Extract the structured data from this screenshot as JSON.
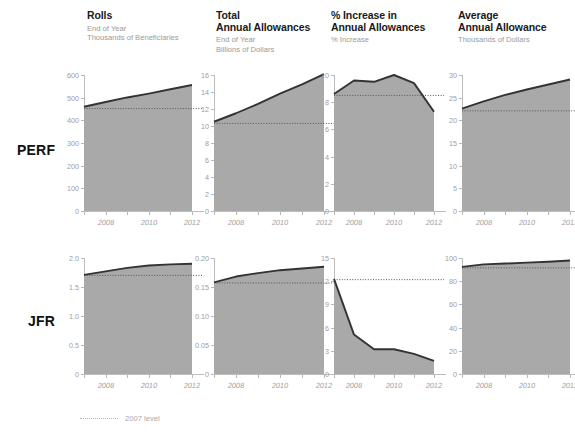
{
  "legend": {
    "label": "2007 level",
    "icon": "dotted-line-icon"
  },
  "row_labels": [
    "PERF",
    "JFR"
  ],
  "colors": {
    "fill": "#a9a9a9",
    "line": "#333333",
    "dotted": "#555555",
    "axis": "#bdbdbd",
    "tick_text": "#9d9d9d",
    "title": "#1a1a1a",
    "subtitle": "#9a9a9a"
  },
  "columns": [
    {
      "title": "Rolls",
      "subtitle": "End of Year\nThousands of Beneficiaries"
    },
    {
      "title": "Total\nAnnual Allowances",
      "subtitle": "End of Year\nBillions of Dollars"
    },
    {
      "title": "% Increase in\n Annual Allowances",
      "subtitle": "% Increase"
    },
    {
      "title": "Average\nAnnual Allowance",
      "subtitle": "Thousands of Dollars"
    }
  ],
  "chart_data": [
    {
      "type": "area",
      "title": "Rolls",
      "row": "PERF",
      "xlabel": "",
      "ylabel": "Thousands of Beneficiaries",
      "x": [
        2007,
        2008,
        2009,
        2010,
        2011,
        2012
      ],
      "xticks": [
        2008,
        2010,
        2012
      ],
      "values": [
        460,
        481,
        501,
        518,
        537,
        556
      ],
      "ylim": [
        0,
        600
      ],
      "yticks": [
        0,
        100,
        200,
        300,
        400,
        500,
        600
      ],
      "ytick_labels": [
        "0",
        "100",
        "200",
        "300",
        "400",
        "500",
        "600"
      ],
      "reference_line": {
        "label": "2007 level",
        "value": 452
      },
      "grid": false,
      "legend": "bottom"
    },
    {
      "type": "area",
      "title": "Total Annual Allowances",
      "row": "PERF",
      "xlabel": "",
      "ylabel": "Billions of Dollars",
      "x": [
        2007,
        2008,
        2009,
        2010,
        2011,
        2012
      ],
      "xticks": [
        2008,
        2010,
        2012
      ],
      "values": [
        10.5,
        11.5,
        12.6,
        13.8,
        14.9,
        16.1
      ],
      "ylim": [
        0,
        16
      ],
      "yticks": [
        0,
        2,
        4,
        6,
        8,
        10,
        12,
        14,
        16
      ],
      "ytick_labels": [
        "0",
        "2",
        "4",
        "6",
        "8",
        "10",
        "12",
        "14",
        "16"
      ],
      "reference_line": {
        "label": "2007 level",
        "value": 10.3
      },
      "grid": false,
      "legend": "bottom"
    },
    {
      "type": "area",
      "title": "% Increase in Annual Allowances",
      "row": "PERF",
      "xlabel": "",
      "ylabel": "% Increase",
      "x": [
        2007,
        2008,
        2009,
        2010,
        2011,
        2012
      ],
      "xticks": [
        2008,
        2010,
        2012
      ],
      "values": [
        8.6,
        9.6,
        9.5,
        10.0,
        9.4,
        7.3
      ],
      "ylim": [
        0,
        10
      ],
      "yticks": [
        0,
        2,
        4,
        6,
        8,
        10
      ],
      "ytick_labels": [
        "0",
        "2",
        "4",
        "6",
        "8",
        "10"
      ],
      "reference_line": {
        "label": "2007 level",
        "value": 8.5
      },
      "grid": false,
      "legend": "bottom"
    },
    {
      "type": "area",
      "title": "Average Annual Allowance",
      "row": "PERF",
      "xlabel": "",
      "ylabel": "Thousands of Dollars",
      "x": [
        2007,
        2008,
        2009,
        2010,
        2011,
        2012
      ],
      "xticks": [
        2008,
        2010,
        2012
      ],
      "values": [
        22.6,
        24.2,
        25.6,
        26.8,
        27.9,
        29.0
      ],
      "ylim": [
        0,
        30
      ],
      "yticks": [
        0,
        5,
        10,
        15,
        20,
        25,
        30
      ],
      "ytick_labels": [
        "0",
        "5",
        "10",
        "15",
        "20",
        "25",
        "30"
      ],
      "reference_line": {
        "label": "2007 level",
        "value": 22.1
      },
      "grid": false,
      "legend": "bottom"
    },
    {
      "type": "area",
      "title": "Rolls",
      "row": "JFR",
      "xlabel": "",
      "ylabel": "Thousands of Beneficiaries",
      "x": [
        2007,
        2008,
        2009,
        2010,
        2011,
        2012
      ],
      "xticks": [
        2008,
        2010,
        2012
      ],
      "values": [
        1.71,
        1.77,
        1.83,
        1.87,
        1.89,
        1.9
      ],
      "ylim": [
        0,
        2.0
      ],
      "yticks": [
        0,
        0.5,
        1.0,
        1.5,
        2.0
      ],
      "ytick_labels": [
        "0",
        "0.5",
        "1.0",
        "1.5",
        "2.0"
      ],
      "reference_line": {
        "label": "2007 level",
        "value": 1.7
      },
      "grid": false,
      "legend": "bottom"
    },
    {
      "type": "area",
      "title": "Total Annual Allowances",
      "row": "JFR",
      "xlabel": "",
      "ylabel": "Billions of Dollars",
      "x": [
        2007,
        2008,
        2009,
        2010,
        2011,
        2012
      ],
      "xticks": [
        2008,
        2010,
        2012
      ],
      "values": [
        0.158,
        0.168,
        0.174,
        0.179,
        0.182,
        0.185
      ],
      "ylim": [
        0,
        0.2
      ],
      "yticks": [
        0,
        0.05,
        0.1,
        0.15,
        0.2
      ],
      "ytick_labels": [
        "0",
        "0.05",
        "0.10",
        "0.15",
        "0.20"
      ],
      "reference_line": {
        "label": "2007 level",
        "value": 0.157
      },
      "grid": false,
      "legend": "bottom"
    },
    {
      "type": "area",
      "title": "% Increase in Annual Allowances",
      "row": "JFR",
      "xlabel": "",
      "ylabel": "% Increase",
      "x": [
        2007,
        2008,
        2009,
        2010,
        2011,
        2012
      ],
      "xticks": [
        2008,
        2010,
        2012
      ],
      "values": [
        12.3,
        5.1,
        3.2,
        3.2,
        2.6,
        1.7
      ],
      "ylim": [
        0,
        15
      ],
      "yticks": [
        0,
        3,
        6,
        9,
        12,
        15
      ],
      "ytick_labels": [
        "0",
        "3",
        "6",
        "9",
        "12",
        "15"
      ],
      "reference_line": {
        "label": "2007 level",
        "value": 12.2
      },
      "grid": false,
      "legend": "bottom"
    },
    {
      "type": "area",
      "title": "Average Annual Allowance",
      "row": "JFR",
      "xlabel": "",
      "ylabel": "Thousands of Dollars",
      "x": [
        2007,
        2008,
        2009,
        2010,
        2011,
        2012
      ],
      "xticks": [
        2008,
        2010,
        2012
      ],
      "values": [
        92.3,
        94.5,
        95.2,
        96.0,
        96.8,
        97.8
      ],
      "ylim": [
        0,
        100
      ],
      "yticks": [
        0,
        20,
        40,
        60,
        80,
        100
      ],
      "ytick_labels": [
        "0",
        "20",
        "40",
        "60",
        "80",
        "100"
      ],
      "reference_line": {
        "label": "2007 level",
        "value": 91.5
      },
      "grid": false,
      "legend": "bottom"
    }
  ]
}
